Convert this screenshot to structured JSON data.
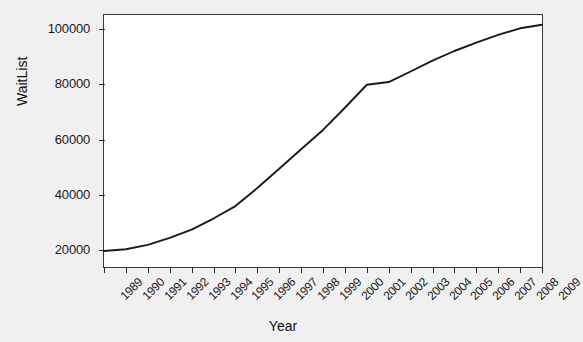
{
  "chart_data": {
    "type": "line",
    "title": "",
    "xlabel": "Year",
    "ylabel": "WaitList",
    "xlim": [
      1989,
      2009
    ],
    "ylim": [
      14000,
      105000
    ],
    "grid": false,
    "legend": "none",
    "line_color": "#1a1a1a",
    "background_color": "#f0f0f0",
    "plot_background_color": "#ffffff",
    "x": [
      1989,
      1990,
      1991,
      1992,
      1993,
      1994,
      1995,
      1996,
      1997,
      1998,
      1999,
      2000,
      2001,
      2002,
      2003,
      2004,
      2005,
      2006,
      2007,
      2008,
      2009
    ],
    "values": [
      19800,
      20400,
      22000,
      24500,
      27500,
      31500,
      36000,
      42500,
      49500,
      56500,
      63500,
      71500,
      79800,
      80800,
      84600,
      88500,
      92000,
      95000,
      97800,
      100200,
      101500
    ],
    "series": [
      {
        "name": "WaitList",
        "values": [
          19800,
          20400,
          22000,
          24500,
          27500,
          31500,
          36000,
          42500,
          49500,
          56500,
          63500,
          71500,
          79800,
          80800,
          84600,
          88500,
          92000,
          95000,
          97800,
          100200,
          101500
        ]
      }
    ],
    "x_tick_labels": [
      "1989",
      "1990",
      "1991",
      "1992",
      "1993",
      "1994",
      "1995",
      "1996",
      "1997",
      "1998",
      "1999",
      "2000",
      "2001",
      "2002",
      "2003",
      "2004",
      "2005",
      "2006",
      "2007",
      "2008",
      "2009"
    ],
    "y_ticks": [
      20000,
      40000,
      60000,
      80000,
      100000
    ],
    "y_tick_labels": [
      "20000",
      "40000",
      "60000",
      "80000",
      "100000"
    ]
  }
}
